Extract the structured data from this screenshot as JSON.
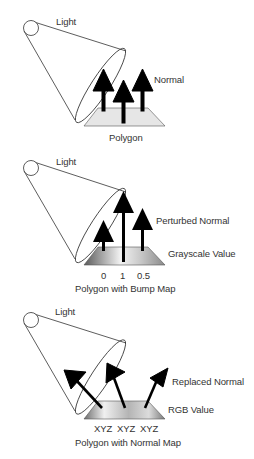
{
  "figure": {
    "topic": "Bump mapping vs normal mapping",
    "panels": [
      {
        "id": "flat",
        "light_label": "Light",
        "normal_label": "Normal",
        "surface_label": "Polygon",
        "surface_fill": "#e6e6e6",
        "values": []
      },
      {
        "id": "bump",
        "light_label": "Light",
        "normal_label": "Perturbed Normal",
        "value_label": "Grayscale Value",
        "surface_label": "Polygon with Bump Map",
        "surface_fill": "grayscale-gradient",
        "values": [
          "0",
          "1",
          "0.5"
        ]
      },
      {
        "id": "normalmap",
        "light_label": "Light",
        "normal_label": "Replaced Normal",
        "value_label": "RGB Value",
        "surface_label": "Polygon with Normal Map",
        "surface_fill": "gray-gradient",
        "values": [
          "XYZ",
          "XYZ",
          "XYZ"
        ]
      }
    ],
    "colors": {
      "arrow": "#000000",
      "outline": "#333333",
      "text": "#333333"
    }
  }
}
